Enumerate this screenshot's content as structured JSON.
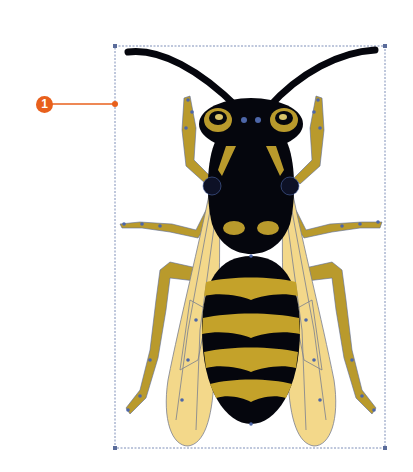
{
  "figure": {
    "callouts": [
      {
        "number": "1",
        "target": "bounding-box-left-edge"
      }
    ],
    "colors": {
      "callout_orange": "#e8601c",
      "body_black": "#05060d",
      "stripe_yellow": "#c4a22a",
      "leg_yellow": "#b99a2c",
      "wing_fill": "#f3d88a",
      "path_outline": "#5a6c9a",
      "anchor_point": "#4d66a8",
      "bounding_box": "#7e8fb8"
    },
    "bounding_box": {
      "x": 115,
      "y": 46,
      "width": 270,
      "height": 402
    }
  }
}
